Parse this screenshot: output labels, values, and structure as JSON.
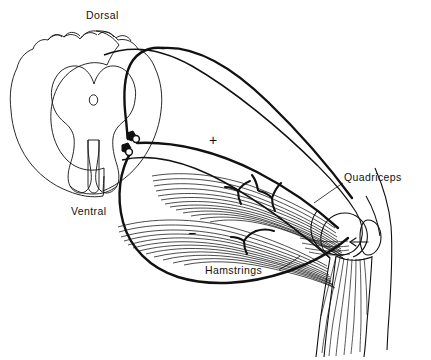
{
  "figure": {
    "kind": "stretch-reflex-diagram",
    "background_color": "#ffffff",
    "ink_color": "#111111"
  },
  "labels": {
    "dorsal": "Dorsal",
    "ventral": "Ventral",
    "quadriceps": "Quadriceps",
    "hamstrings": "Hamstrings"
  },
  "signs": {
    "excitatory": "+",
    "inhibitory": "−"
  },
  "parts": {
    "spinal_cord": "spinal-cord-cross-section",
    "gray_matter": "gray-matter-butterfly",
    "central_canal": "central-canal",
    "synapse_upper": "synaptic-terminal-upper",
    "synapse_lower": "synaptic-terminal-lower",
    "afferent_nerve": "sensory-afferent-fiber",
    "efferent_excitatory": "motor-efferent-to-quadriceps",
    "efferent_inhibitory": "motor-efferent-to-hamstrings",
    "quadriceps_muscle": "quadriceps-muscle-belly",
    "hamstrings_muscle": "hamstrings-muscle-belly",
    "patella": "patella",
    "femur": "femur-condyle",
    "tibia": "tibia",
    "movement_arrow": "knee-extension-arrow"
  }
}
